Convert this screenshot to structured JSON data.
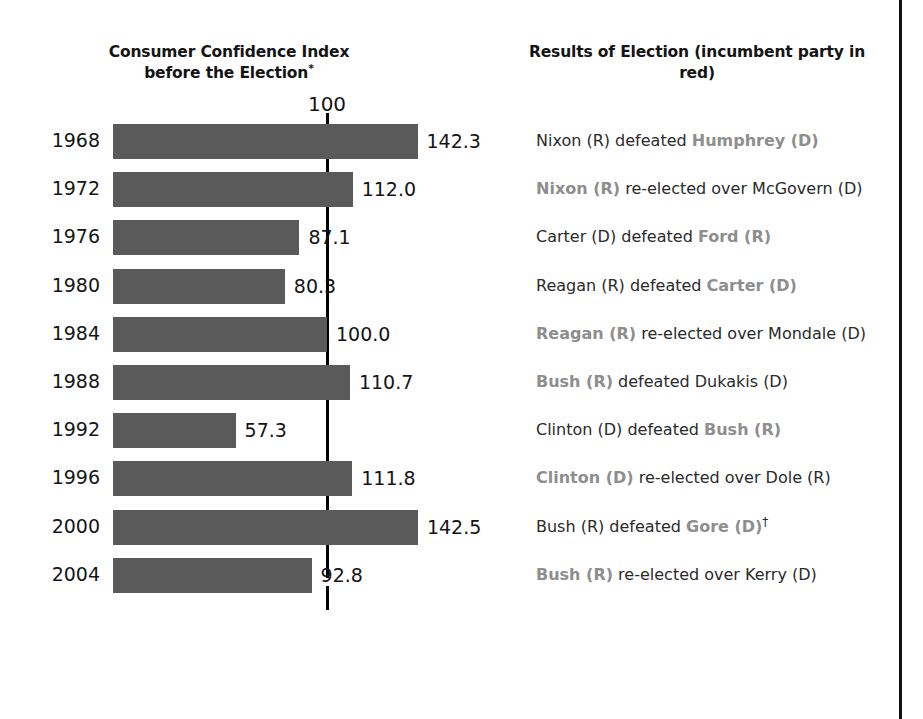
{
  "headers": {
    "left": "Consumer Confidence Index before the Election",
    "left_footnote_marker": "*",
    "right": "Results of Election (incumbent party in red)"
  },
  "axis": {
    "tick_label": "100",
    "tick_value": 100
  },
  "accent_colors": {
    "bar": "#5a5a5a",
    "reference_line": "#000000",
    "incumbent_text": "#8e8e8e",
    "text": "#2a2a2a",
    "background": "#ffffff"
  },
  "rows": [
    {
      "year": "1968",
      "value": 142.3,
      "value_label": "142.3",
      "result_pre": "Nixon (R) defeated ",
      "result_incumbent": "Humphrey (D)",
      "result_post": "",
      "dagger": ""
    },
    {
      "year": "1972",
      "value": 112.0,
      "value_label": "112.0",
      "result_pre": "",
      "result_incumbent": "Nixon (R)",
      "result_post": " re-elected over McGovern (D)",
      "dagger": ""
    },
    {
      "year": "1976",
      "value": 87.1,
      "value_label": "87.1",
      "result_pre": "Carter (D) defeated ",
      "result_incumbent": "Ford (R)",
      "result_post": "",
      "dagger": ""
    },
    {
      "year": "1980",
      "value": 80.3,
      "value_label": "80.3",
      "result_pre": "Reagan (R) defeated ",
      "result_incumbent": "Carter (D)",
      "result_post": "",
      "dagger": ""
    },
    {
      "year": "1984",
      "value": 100.0,
      "value_label": "100.0",
      "result_pre": "",
      "result_incumbent": "Reagan (R)",
      "result_post": " re-elected over Mondale (D)",
      "dagger": ""
    },
    {
      "year": "1988",
      "value": 110.7,
      "value_label": "110.7",
      "result_pre": "",
      "result_incumbent": "Bush (R)",
      "result_post": " defeated Dukakis (D)",
      "dagger": ""
    },
    {
      "year": "1992",
      "value": 57.3,
      "value_label": "57.3",
      "result_pre": "Clinton (D) defeated ",
      "result_incumbent": "Bush (R)",
      "result_post": "",
      "dagger": ""
    },
    {
      "year": "1996",
      "value": 111.8,
      "value_label": "111.8",
      "result_pre": "",
      "result_incumbent": "Clinton (D)",
      "result_post": " re-elected over Dole (R)",
      "dagger": ""
    },
    {
      "year": "2000",
      "value": 142.5,
      "value_label": "142.5",
      "result_pre": "Bush (R) defeated ",
      "result_incumbent": "Gore (D)",
      "result_post": "",
      "dagger": "†"
    },
    {
      "year": "2004",
      "value": 92.8,
      "value_label": "92.8",
      "result_pre": "",
      "result_incumbent": "Bush (R)",
      "result_post": " re-elected over Kerry (D)",
      "dagger": ""
    }
  ],
  "chart_data": {
    "type": "bar",
    "orientation": "horizontal",
    "title": "Consumer Confidence Index before the Election*",
    "xlabel": "",
    "ylabel": "",
    "categories": [
      "1968",
      "1972",
      "1976",
      "1980",
      "1984",
      "1988",
      "1992",
      "1996",
      "2000",
      "2004"
    ],
    "values": [
      142.3,
      112.0,
      87.1,
      80.3,
      100.0,
      110.7,
      57.3,
      111.8,
      142.5,
      92.8
    ],
    "data_labels": [
      "142.3",
      "112.0",
      "87.1",
      "80.3",
      "100.0",
      "110.7",
      "57.3",
      "111.8",
      "142.5",
      "92.8"
    ],
    "xlim": [
      0,
      160
    ],
    "grid": false,
    "legend": null,
    "reference_lines": [
      {
        "value": 100,
        "label": "100",
        "orientation": "vertical"
      }
    ],
    "bar_color": "#5a5a5a",
    "annotations": [
      "Nixon (R) defeated Humphrey (D)",
      "Nixon (R) re-elected over McGovern (D)",
      "Carter (D) defeated Ford (R)",
      "Reagan (R) defeated Carter (D)",
      "Reagan (R) re-elected over Mondale (D)",
      "Bush (R) defeated Dukakis (D)",
      "Clinton (D) defeated Bush (R)",
      "Clinton (D) re-elected over Dole (R)",
      "Bush (R) defeated Gore (D)†",
      "Bush (R) re-elected over Kerry (D)"
    ]
  }
}
